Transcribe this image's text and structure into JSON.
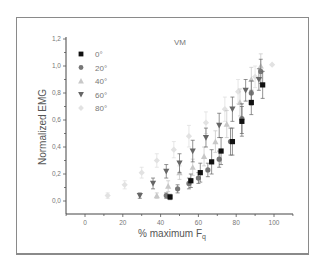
{
  "chart_data": {
    "type": "scatter",
    "title": "VM",
    "xlabel": "% maximum F",
    "xlabel_subscript": "q",
    "ylabel": "Normalized EMG",
    "xlim": [
      -10,
      110
    ],
    "ylim": [
      -0.1,
      1.2
    ],
    "xticks": [
      "0",
      "20",
      "40",
      "60",
      "80",
      "100"
    ],
    "yticks": [
      "0,0",
      "0,2",
      "0,4",
      "0,6",
      "0,8",
      "1,0",
      "1,2"
    ],
    "grid": false,
    "legend_position": "upper-left",
    "series": [
      {
        "name": "0°",
        "marker": "square",
        "color": "#111111",
        "x": [
          45,
          56,
          61,
          67,
          72,
          78,
          83,
          88,
          94
        ],
        "y": [
          0.03,
          0.15,
          0.21,
          0.29,
          0.37,
          0.44,
          0.59,
          0.73,
          0.86
        ],
        "err": [
          0.02,
          0.05,
          0.07,
          0.09,
          0.1,
          0.1,
          0.11,
          0.09,
          0.1
        ]
      },
      {
        "name": "20°",
        "marker": "circle",
        "color": "#777777",
        "x": [
          43,
          49,
          55,
          60,
          65,
          71,
          77,
          83,
          88,
          93
        ],
        "y": [
          0.04,
          0.09,
          0.13,
          0.17,
          0.23,
          0.31,
          0.44,
          0.61,
          0.8,
          0.96
        ],
        "err": [
          0.02,
          0.03,
          0.04,
          0.04,
          0.05,
          0.06,
          0.1,
          0.11,
          0.09,
          0.09
        ]
      },
      {
        "name": "40°",
        "marker": "triangle-up",
        "color": "#c8c8c8",
        "x": [
          38,
          44,
          50,
          57,
          63,
          69,
          75,
          82,
          88,
          93
        ],
        "y": [
          0.04,
          0.11,
          0.21,
          0.25,
          0.33,
          0.44,
          0.57,
          0.73,
          0.9,
          1.0
        ],
        "err": [
          0.02,
          0.04,
          0.05,
          0.06,
          0.07,
          0.08,
          0.1,
          0.1,
          0.09,
          0.09
        ]
      },
      {
        "name": "60°",
        "marker": "triangle-down",
        "color": "#666666",
        "x": [
          29,
          36,
          43,
          50,
          57,
          64,
          71,
          78,
          85,
          92
        ],
        "y": [
          0.04,
          0.13,
          0.22,
          0.28,
          0.37,
          0.47,
          0.56,
          0.68,
          0.82,
          0.9
        ],
        "err": [
          0.02,
          0.04,
          0.05,
          0.07,
          0.08,
          0.07,
          0.09,
          0.09,
          0.08,
          0.08
        ]
      },
      {
        "name": "80°",
        "marker": "diamond",
        "color": "#e2e2e2",
        "x": [
          12,
          21,
          30,
          38,
          47,
          55,
          64,
          74,
          81,
          90,
          99
        ],
        "y": [
          0.04,
          0.12,
          0.21,
          0.3,
          0.38,
          0.48,
          0.58,
          0.68,
          0.81,
          0.92,
          1.01
        ],
        "err": [
          0.02,
          0.03,
          0.04,
          0.05,
          0.06,
          0.08,
          0.08,
          0.09,
          0.09,
          0.08,
          0.0
        ]
      }
    ]
  }
}
